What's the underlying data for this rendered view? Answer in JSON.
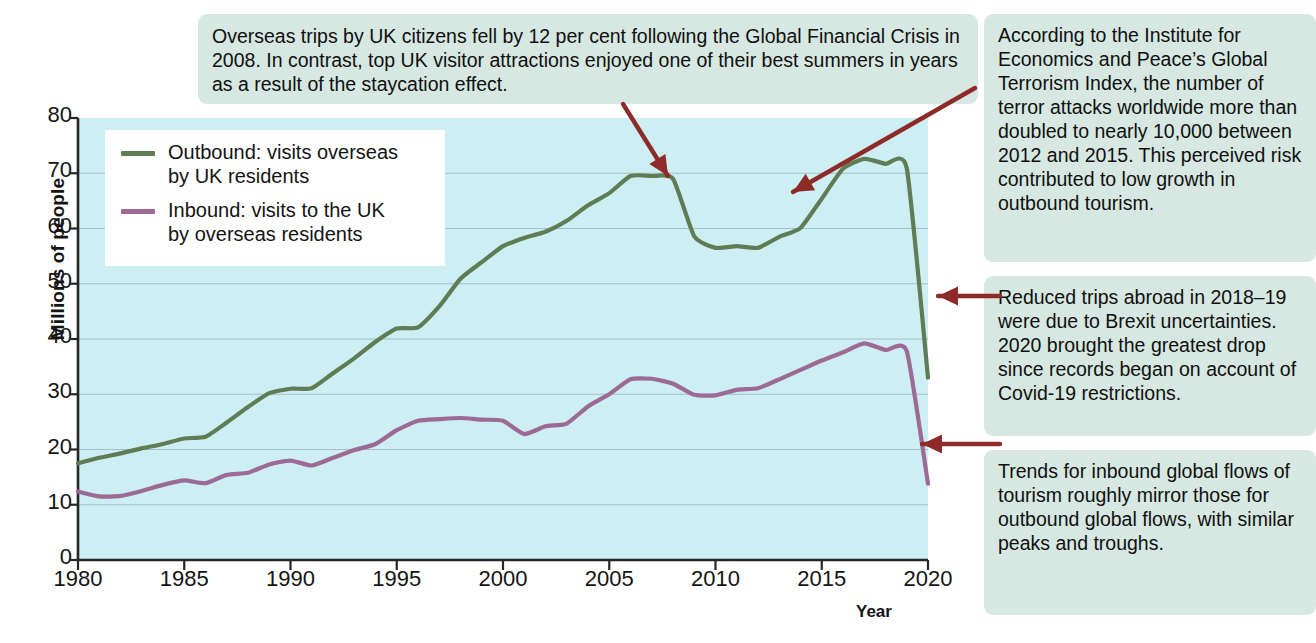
{
  "chart_data": {
    "type": "line",
    "title": "",
    "xlabel": "Year",
    "ylabel": "Millions of people",
    "xlim": [
      1980,
      2020
    ],
    "ylim": [
      0,
      80
    ],
    "xticks": [
      "1980",
      "1985",
      "1990",
      "1995",
      "2000",
      "2005",
      "2010",
      "2015",
      "2020"
    ],
    "yticks": [
      "0",
      "10",
      "20",
      "30",
      "40",
      "50",
      "60",
      "70",
      "80"
    ],
    "grid": "horizontal",
    "legend_position": "top-left inside plot",
    "x": [
      1980,
      1981,
      1982,
      1983,
      1984,
      1985,
      1986,
      1987,
      1988,
      1989,
      1990,
      1991,
      1992,
      1993,
      1994,
      1995,
      1996,
      1997,
      1998,
      1999,
      2000,
      2001,
      2002,
      2003,
      2004,
      2005,
      2006,
      2007,
      2008,
      2009,
      2010,
      2011,
      2012,
      2013,
      2014,
      2015,
      2016,
      2017,
      2018,
      2019,
      2020
    ],
    "series": [
      {
        "name": "Outbound: visits overseas by UK residents",
        "color": "#5e7d55",
        "values": [
          17.5,
          18.5,
          19.3,
          20.2,
          21.0,
          22.0,
          22.3,
          24.9,
          27.7,
          30.2,
          31.0,
          31.1,
          33.8,
          36.5,
          39.5,
          41.9,
          42.1,
          45.9,
          50.9,
          53.9,
          56.8,
          58.3,
          59.4,
          61.4,
          64.2,
          66.4,
          69.5,
          69.5,
          69.0,
          58.6,
          56.5,
          56.8,
          56.5,
          58.5,
          60.1,
          65.4,
          70.8,
          72.6,
          71.7,
          70.9,
          33.0
        ]
      },
      {
        "name": "Inbound: visits to the UK by overseas residents",
        "color": "#9c6a95",
        "values": [
          12.4,
          11.5,
          11.6,
          12.5,
          13.6,
          14.4,
          13.9,
          15.4,
          15.8,
          17.3,
          18.0,
          17.1,
          18.5,
          19.9,
          21.0,
          23.5,
          25.2,
          25.5,
          25.7,
          25.4,
          25.2,
          22.8,
          24.2,
          24.7,
          27.8,
          30.0,
          32.7,
          32.8,
          31.9,
          29.9,
          29.8,
          30.8,
          31.1,
          32.7,
          34.4,
          36.1,
          37.6,
          39.2,
          38.0,
          37.8,
          13.8
        ]
      }
    ],
    "colors": {
      "plot_background": "#cdeef2",
      "gridline": "#8fa6b8",
      "axis": "#262626",
      "legend_background": "#ffffff",
      "callout_background": "#d6e8e1",
      "arrow": "#8e2b28",
      "page_background": "#ffffff"
    }
  },
  "axis": {
    "y_title": "Millions of people",
    "x_title": "Year"
  },
  "legend": {
    "items": [
      {
        "label_line1": "Outbound: visits overseas",
        "label_line2": "by UK residents",
        "color": "#5e7d55"
      },
      {
        "label_line1": "Inbound: visits to the UK",
        "label_line2": "by overseas residents",
        "color": "#9c6a95"
      }
    ]
  },
  "callouts": {
    "gfc": "Overseas trips by UK citizens fell by 12 per cent following the Global Financial Crisis in 2008. In contrast, top UK visitor attractions enjoyed one of their best summers in years as a result of the staycation effect.",
    "terrorism": "According to the Institute for Economics and Peace’s Global Terrorism Index, the number of terror attacks worldwide more than doubled to nearly 10,000 between 2012 and 2015. This perceived risk contributed to low growth in outbound tourism.",
    "brexit": "Reduced trips abroad in 2018–19 were due to Brexit uncertainties. 2020 brought the greatest drop since records began on account of Covid-19 restrictions.",
    "inbound": "Trends for inbound global flows of tourism roughly mirror those for outbound global flows, with similar peaks and troughs."
  }
}
